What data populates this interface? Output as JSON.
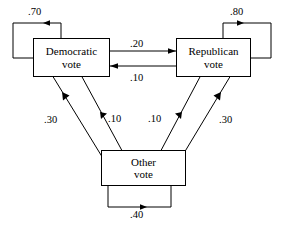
{
  "diagram": {
    "type": "state-transition-diagram",
    "nodes": [
      {
        "id": "democratic",
        "label_line1": "Democratic",
        "label_line2": "vote"
      },
      {
        "id": "republican",
        "label_line1": "Republican",
        "label_line2": "vote"
      },
      {
        "id": "other",
        "label_line1": "Other",
        "label_line2": "vote"
      }
    ],
    "edges": [
      {
        "id": "dem-self",
        "from": "democratic",
        "to": "democratic",
        "label": ".70"
      },
      {
        "id": "rep-self",
        "from": "republican",
        "to": "republican",
        "label": ".80"
      },
      {
        "id": "oth-self",
        "from": "other",
        "to": "other",
        "label": ".40"
      },
      {
        "id": "dem-to-rep",
        "from": "democratic",
        "to": "republican",
        "label": ".20"
      },
      {
        "id": "rep-to-dem",
        "from": "republican",
        "to": "democratic",
        "label": ".10"
      },
      {
        "id": "dem-to-oth",
        "from": "democratic",
        "to": "other",
        "label": ".10"
      },
      {
        "id": "rep-to-oth",
        "from": "republican",
        "to": "other",
        "label": ".10"
      },
      {
        "id": "oth-to-dem",
        "from": "other",
        "to": "democratic",
        "label": ".30"
      },
      {
        "id": "oth-to-rep",
        "from": "other",
        "to": "republican",
        "label": ".30"
      }
    ],
    "colors": {
      "stroke": "#000000",
      "background": "#ffffff",
      "text": "#000000"
    }
  }
}
